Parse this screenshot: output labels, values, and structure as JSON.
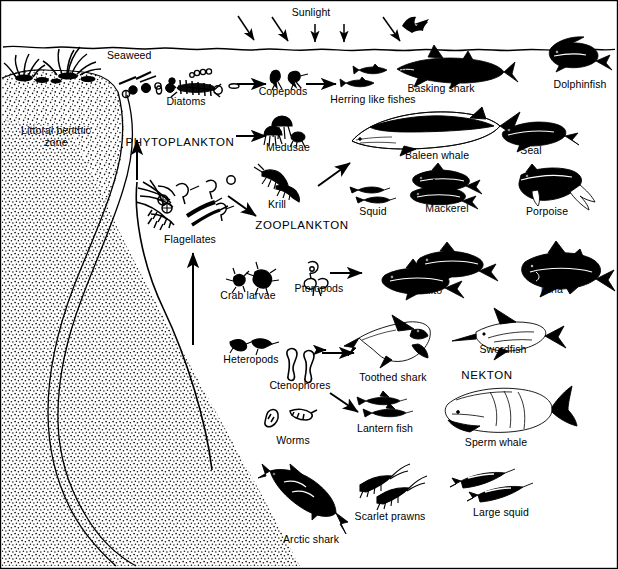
{
  "diagram": {
    "colors": {
      "ink": "#000000",
      "paper": "#ffffff",
      "sediment_stipple": "#1a1a1a"
    },
    "environment": {
      "sunlight_label": "Sunlight",
      "sea_surface": "wavy waterline",
      "seabed_label": "Littoral benthic zone"
    },
    "labels": [
      {
        "id": "sunlight",
        "text": "Sunlight",
        "x": 311,
        "y": 13,
        "anchor": "middle",
        "style": "plain"
      },
      {
        "id": "seaweed",
        "text": "Seaweed",
        "x": 107,
        "y": 56,
        "anchor": "start",
        "style": "plain"
      },
      {
        "id": "diatoms",
        "text": "Diatoms",
        "x": 186,
        "y": 101,
        "anchor": "middle",
        "style": "plain"
      },
      {
        "id": "copepods",
        "text": "Copepods",
        "x": 283,
        "y": 91,
        "anchor": "middle",
        "style": "plain"
      },
      {
        "id": "herring",
        "text": "Herring like fishes",
        "x": 373,
        "y": 99,
        "anchor": "middle",
        "style": "plain"
      },
      {
        "id": "basking-shark",
        "text": "Basking shark",
        "x": 441,
        "y": 88,
        "anchor": "middle",
        "style": "plain"
      },
      {
        "id": "dolphinfish",
        "text": "Dolphinfish",
        "x": 580,
        "y": 84,
        "anchor": "middle",
        "style": "plain"
      },
      {
        "id": "littoral",
        "text": "Littoral benthic\nzone",
        "x": 56,
        "y": 137,
        "anchor": "middle",
        "style": "two-line"
      },
      {
        "id": "phytoplankton",
        "text": "PHYTOPLANKTON",
        "x": 180,
        "y": 143,
        "anchor": "middle",
        "style": "caps"
      },
      {
        "id": "medusae",
        "text": "Medusae",
        "x": 288,
        "y": 147,
        "anchor": "middle",
        "style": "plain"
      },
      {
        "id": "baleen-whale",
        "text": "Baleen whale",
        "x": 437,
        "y": 155,
        "anchor": "middle",
        "style": "plain"
      },
      {
        "id": "seal",
        "text": "Seal",
        "x": 531,
        "y": 150,
        "anchor": "middle",
        "style": "plain"
      },
      {
        "id": "krill",
        "text": "Krill",
        "x": 277,
        "y": 204,
        "anchor": "middle",
        "style": "plain"
      },
      {
        "id": "squid",
        "text": "Squid",
        "x": 373,
        "y": 211,
        "anchor": "middle",
        "style": "plain"
      },
      {
        "id": "mackerel",
        "text": "Mackerel",
        "x": 447,
        "y": 208,
        "anchor": "middle",
        "style": "plain"
      },
      {
        "id": "porpoise",
        "text": "Porpoise",
        "x": 547,
        "y": 211,
        "anchor": "middle",
        "style": "plain"
      },
      {
        "id": "zooplankton",
        "text": "ZOOPLANKTON",
        "x": 302,
        "y": 226,
        "anchor": "middle",
        "style": "caps"
      },
      {
        "id": "flagellates",
        "text": "Flagellates",
        "x": 190,
        "y": 239,
        "anchor": "middle",
        "style": "plain"
      },
      {
        "id": "crab-larvae",
        "text": "Crab larvae",
        "x": 248,
        "y": 295,
        "anchor": "middle",
        "style": "plain"
      },
      {
        "id": "pteropods",
        "text": "Pteropods",
        "x": 319,
        "y": 288,
        "anchor": "middle",
        "style": "plain"
      },
      {
        "id": "bonito",
        "text": "Bonito",
        "x": 427,
        "y": 290,
        "anchor": "middle",
        "style": "plain"
      },
      {
        "id": "tuna",
        "text": "Tuna",
        "x": 551,
        "y": 289,
        "anchor": "middle",
        "style": "plain"
      },
      {
        "id": "heteropods",
        "text": "Heteropods",
        "x": 251,
        "y": 359,
        "anchor": "middle",
        "style": "plain"
      },
      {
        "id": "ctenophores",
        "text": "Ctenophores",
        "x": 300,
        "y": 385,
        "anchor": "middle",
        "style": "plain"
      },
      {
        "id": "toothed-shark",
        "text": "Toothed shark",
        "x": 393,
        "y": 377,
        "anchor": "middle",
        "style": "plain"
      },
      {
        "id": "swordfish",
        "text": "Swordfish",
        "x": 503,
        "y": 350,
        "anchor": "middle",
        "style": "plain"
      },
      {
        "id": "nekton",
        "text": "NEKTON",
        "x": 487,
        "y": 375,
        "anchor": "middle",
        "style": "caps"
      },
      {
        "id": "worms",
        "text": "Worms",
        "x": 293,
        "y": 440,
        "anchor": "middle",
        "style": "plain"
      },
      {
        "id": "lantern-fish",
        "text": "Lantern fish",
        "x": 385,
        "y": 428,
        "anchor": "middle",
        "style": "plain"
      },
      {
        "id": "sperm-whale",
        "text": "Sperm whale",
        "x": 496,
        "y": 442,
        "anchor": "middle",
        "style": "plain"
      },
      {
        "id": "scarlet-prawns",
        "text": "Scarlet prawns",
        "x": 390,
        "y": 516,
        "anchor": "middle",
        "style": "plain"
      },
      {
        "id": "large-squid",
        "text": "Large squid",
        "x": 501,
        "y": 512,
        "anchor": "middle",
        "style": "plain"
      },
      {
        "id": "arctic-shark",
        "text": "Arctic shark",
        "x": 311,
        "y": 539,
        "anchor": "middle",
        "style": "plain"
      }
    ],
    "organisms": [
      {
        "id": "seaweed",
        "name": "Seaweed",
        "group": "producer"
      },
      {
        "id": "diatoms",
        "name": "Diatoms",
        "group": "phytoplankton"
      },
      {
        "id": "flagellates",
        "name": "Flagellates",
        "group": "phytoplankton"
      },
      {
        "id": "copepods",
        "name": "Copepods",
        "group": "zooplankton"
      },
      {
        "id": "medusae",
        "name": "Medusae",
        "group": "zooplankton"
      },
      {
        "id": "krill",
        "name": "Krill",
        "group": "zooplankton"
      },
      {
        "id": "crab-larvae",
        "name": "Crab larvae",
        "group": "zooplankton"
      },
      {
        "id": "pteropods",
        "name": "Pteropods",
        "group": "zooplankton"
      },
      {
        "id": "heteropods",
        "name": "Heteropods",
        "group": "zooplankton"
      },
      {
        "id": "ctenophores",
        "name": "Ctenophores",
        "group": "zooplankton"
      },
      {
        "id": "worms",
        "name": "Worms",
        "group": "zooplankton"
      },
      {
        "id": "herring",
        "name": "Herring like fishes",
        "group": "nekton"
      },
      {
        "id": "basking-shark",
        "name": "Basking shark",
        "group": "nekton"
      },
      {
        "id": "dolphinfish",
        "name": "Dolphinfish",
        "group": "nekton"
      },
      {
        "id": "baleen-whale",
        "name": "Baleen whale",
        "group": "nekton"
      },
      {
        "id": "seal",
        "name": "Seal",
        "group": "nekton"
      },
      {
        "id": "squid",
        "name": "Squid",
        "group": "nekton"
      },
      {
        "id": "mackerel",
        "name": "Mackerel",
        "group": "nekton"
      },
      {
        "id": "porpoise",
        "name": "Porpoise",
        "group": "nekton"
      },
      {
        "id": "bonito",
        "name": "Bonito",
        "group": "nekton"
      },
      {
        "id": "tuna",
        "name": "Tuna",
        "group": "nekton"
      },
      {
        "id": "toothed-shark",
        "name": "Toothed shark",
        "group": "nekton"
      },
      {
        "id": "swordfish",
        "name": "Swordfish",
        "group": "nekton"
      },
      {
        "id": "lantern-fish",
        "name": "Lantern fish",
        "group": "nekton"
      },
      {
        "id": "sperm-whale",
        "name": "Sperm whale",
        "group": "nekton"
      },
      {
        "id": "scarlet-prawns",
        "name": "Scarlet prawns",
        "group": "nekton"
      },
      {
        "id": "large-squid",
        "name": "Large squid",
        "group": "nekton"
      },
      {
        "id": "arctic-shark",
        "name": "Arctic shark",
        "group": "nekton"
      }
    ],
    "flows": [
      {
        "from": "diatoms",
        "to": "copepods"
      },
      {
        "from": "copepods",
        "to": "herring"
      },
      {
        "from": "phytoplankton",
        "to": "medusae"
      },
      {
        "from": "zooplankton",
        "to": "baleen-whale"
      },
      {
        "from": "krill",
        "to": "zooplankton"
      },
      {
        "from": "benthic",
        "to": "phytoplankton"
      },
      {
        "from": "flagellates",
        "to": "zooplankton"
      },
      {
        "from": "seabed",
        "to": "flagellates"
      },
      {
        "from": "pteropods",
        "to": "bonito"
      },
      {
        "from": "ctenophores",
        "to": "toothed-shark"
      },
      {
        "from": "ctenophores",
        "to": "lantern-fish"
      },
      {
        "from": "heteropods",
        "to": "toothed-shark"
      }
    ],
    "sunlight_rays": 6
  }
}
